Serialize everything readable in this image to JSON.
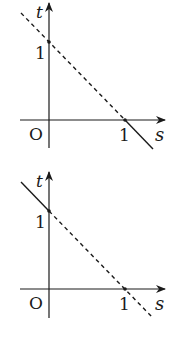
{
  "graphs": [
    {
      "id": "top",
      "axis_labels": {
        "x": "s",
        "y": "t",
        "origin": "O"
      },
      "ticks": {
        "x": "1",
        "y": "1"
      },
      "line": {
        "equation": "s + t = 1",
        "dashed_part": "s < 1",
        "solid_part": "s > 1"
      }
    },
    {
      "id": "bottom",
      "axis_labels": {
        "x": "s",
        "y": "t",
        "origin": "O"
      },
      "ticks": {
        "x": "1",
        "y": "1"
      },
      "line": {
        "equation": "s + t = 1",
        "dashed_part": "s > 0",
        "solid_part": "s < 0"
      }
    }
  ],
  "colors": {
    "ink": "#1a1a1a",
    "background": "#ffffff"
  }
}
